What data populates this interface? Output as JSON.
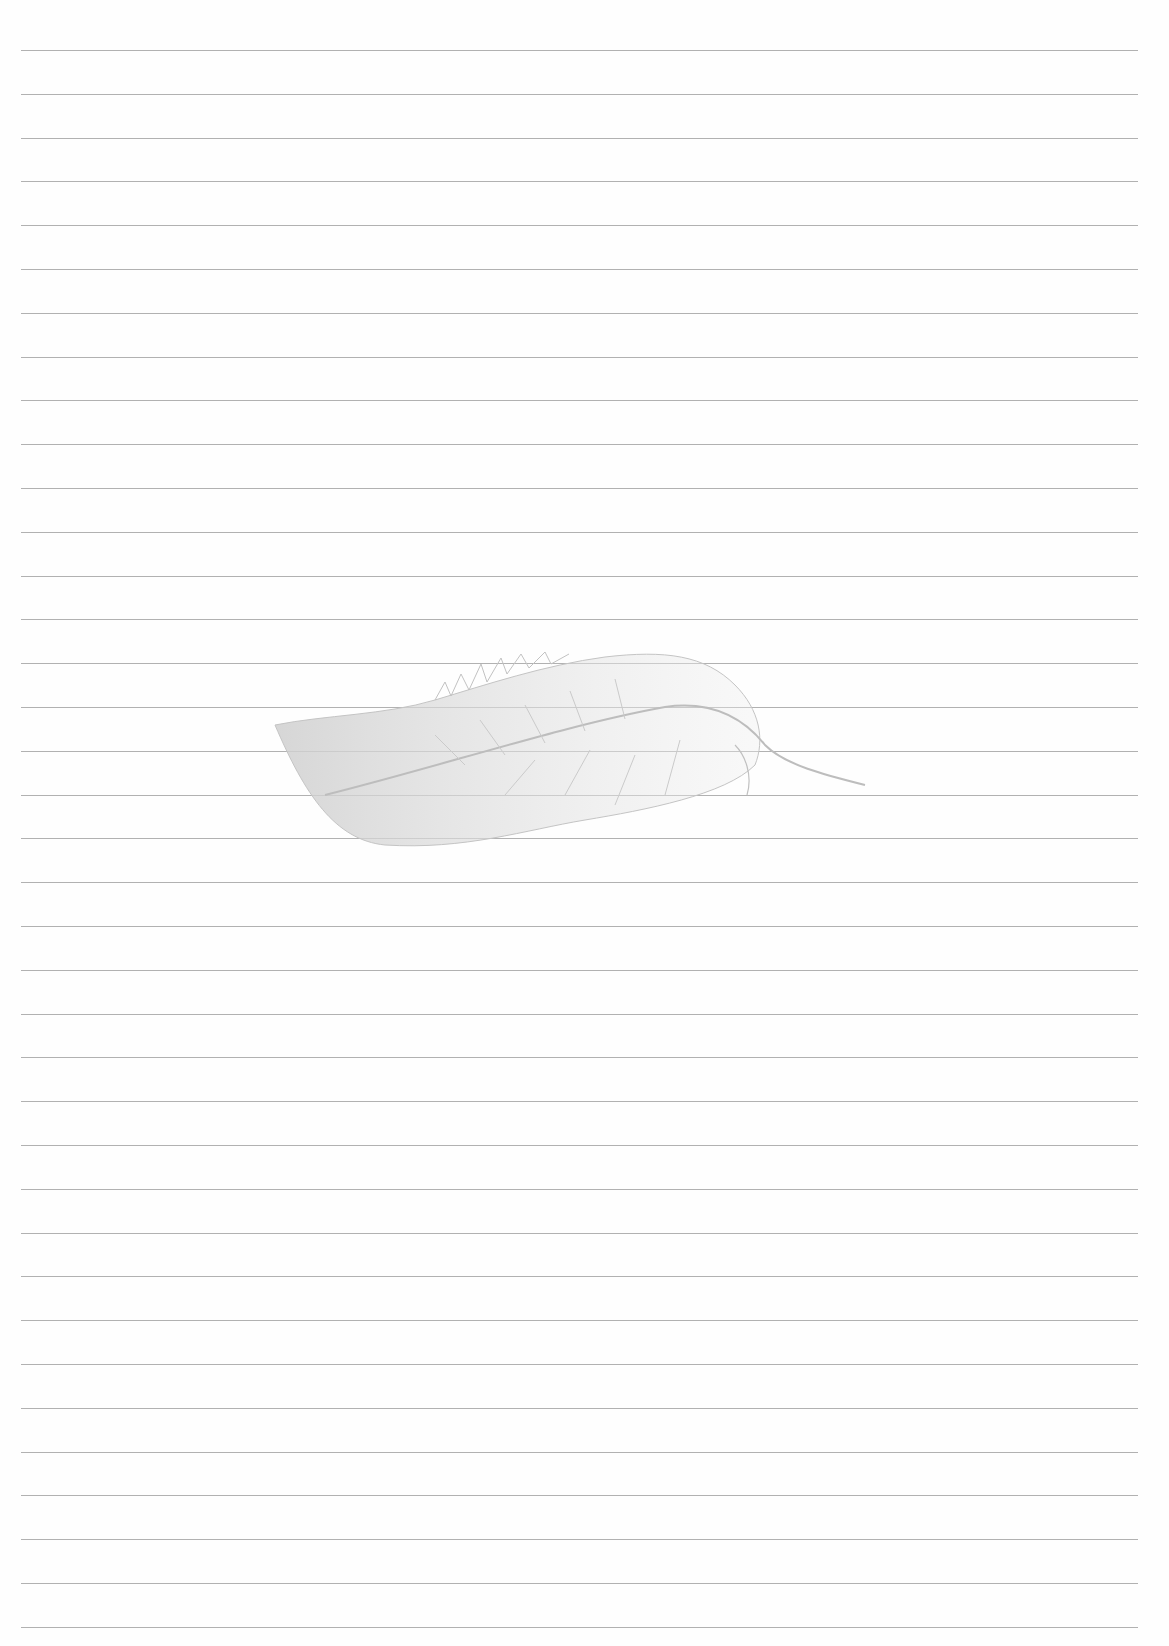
{
  "page": {
    "type": "lined-paper",
    "background_color": "#fefefe",
    "rule_color": "#a3a3a3",
    "rule_count": 37,
    "first_rule_y": 50,
    "rule_spacing": 43.8,
    "rule_left": 21,
    "rule_width": 1117
  },
  "watermark": {
    "icon": "feather-icon",
    "color": "#c8c8c8"
  }
}
